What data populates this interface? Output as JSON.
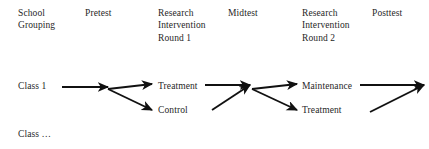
{
  "diagram": {
    "title_row": [
      {
        "name": "school-grouping",
        "text": "School\nGrouping",
        "x": 18,
        "y": 7
      },
      {
        "name": "pretest",
        "text": "Pretest",
        "x": 85,
        "y": 7
      },
      {
        "name": "research-intervention-round-1",
        "text": "Research\nIntervention\nRound 1",
        "x": 158,
        "y": 7
      },
      {
        "name": "midtest",
        "text": "Midtest",
        "x": 228,
        "y": 7
      },
      {
        "name": "research-intervention-round-2",
        "text": "Research\nIntervention\nRound 2",
        "x": 302,
        "y": 7
      },
      {
        "name": "posttest",
        "text": "Posttest",
        "x": 372,
        "y": 7
      }
    ],
    "nodes": [
      {
        "name": "class-1",
        "text": "Class 1",
        "x": 18,
        "y": 80
      },
      {
        "name": "treatment-round1",
        "text": "Treatment",
        "x": 158,
        "y": 80
      },
      {
        "name": "control-round1",
        "text": "Control",
        "x": 158,
        "y": 104
      },
      {
        "name": "maintenance",
        "text": "Maintenance",
        "x": 302,
        "y": 80
      },
      {
        "name": "treatment-round2",
        "text": "Treatment",
        "x": 302,
        "y": 104
      },
      {
        "name": "class-ellipsis",
        "text": "Class …",
        "x": 18,
        "y": 128
      }
    ],
    "arrow_color": "#111111",
    "arrows": [
      {
        "name": "arrow-class1-to-split1",
        "x1": 62,
        "y1": 87,
        "x2": 108,
        "y2": 87
      },
      {
        "name": "arrow-split1-to-treatment-round1",
        "x1": 108,
        "y1": 89,
        "x2": 152,
        "y2": 84
      },
      {
        "name": "arrow-split1-to-control-round1",
        "x1": 108,
        "y1": 89,
        "x2": 152,
        "y2": 110
      },
      {
        "name": "arrow-treatment-round1-to-merge",
        "x1": 205,
        "y1": 85,
        "x2": 250,
        "y2": 85
      },
      {
        "name": "arrow-control-round1-to-merge",
        "x1": 212,
        "y1": 110,
        "x2": 250,
        "y2": 85
      },
      {
        "name": "arrow-merge-to-maintenance",
        "x1": 252,
        "y1": 89,
        "x2": 297,
        "y2": 84
      },
      {
        "name": "arrow-merge-to-treatment-round2",
        "x1": 252,
        "y1": 89,
        "x2": 297,
        "y2": 110
      },
      {
        "name": "arrow-maintenance-to-posttest",
        "x1": 360,
        "y1": 85,
        "x2": 424,
        "y2": 85
      },
      {
        "name": "arrow-treatment-round2-to-posttest",
        "x1": 370,
        "y1": 112,
        "x2": 424,
        "y2": 85
      }
    ]
  }
}
